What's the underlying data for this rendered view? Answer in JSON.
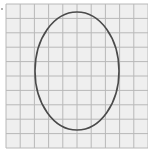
{
  "figure": {
    "type": "grid-with-ellipse",
    "grid": {
      "columns": 10,
      "rows": 10,
      "x0": 6,
      "y0": 4,
      "cell_w": 14.2,
      "cell_h": 14.4,
      "background": "#efefef",
      "line_color": "#b8b8b8"
    },
    "ellipse": {
      "cx": 77,
      "cy": 71,
      "rx": 42,
      "ry": 59,
      "stroke": "#4a4a4a",
      "stroke_width": 1.6,
      "fill": "none"
    }
  }
}
